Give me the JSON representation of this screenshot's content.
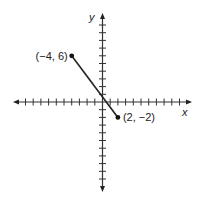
{
  "chart_data": {
    "type": "line",
    "title": "",
    "xlabel": "x",
    "ylabel": "y",
    "xlim": [
      -12,
      11
    ],
    "ylim": [
      -11,
      11
    ],
    "grid": false,
    "tick_labels": false,
    "series": [
      {
        "name": "segment",
        "points": [
          {
            "x": -4,
            "y": 6,
            "label": "(−4, 6)"
          },
          {
            "x": 2,
            "y": -2,
            "label": "(2, −2)"
          }
        ]
      }
    ],
    "colors": {
      "axis": "#333333",
      "line": "#222222",
      "point": "#111111"
    }
  },
  "labels": {
    "x_axis": "x",
    "y_axis": "y",
    "point_a": "(−4, 6)",
    "point_b": "(2, −2)"
  }
}
